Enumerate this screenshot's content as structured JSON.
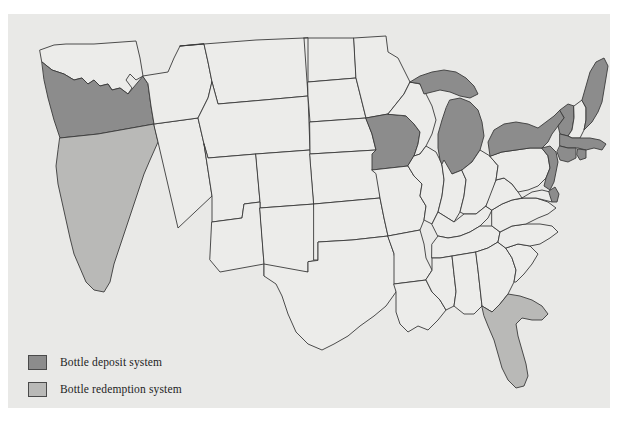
{
  "figure": {
    "panel_background": "#e9e9e7",
    "page_background": "#ffffff"
  },
  "map": {
    "region": "United States",
    "outline_color": "#3a3a3a",
    "unshaded_fill": "#ececea",
    "categories": [
      {
        "key": "deposit",
        "label": "Bottle deposit system",
        "color": "#8c8c8c",
        "states": [
          "Oregon",
          "Iowa",
          "Michigan",
          "New York",
          "Vermont",
          "Maine",
          "Massachusetts",
          "Connecticut",
          "Rhode Island",
          "New Jersey",
          "Delaware"
        ]
      },
      {
        "key": "redemption",
        "label": "Bottle redemption system",
        "color": "#b9b9b7",
        "states": [
          "California",
          "Florida"
        ]
      },
      {
        "key": "none",
        "label": "",
        "color": "#ececea",
        "states": [
          "Washington",
          "Idaho",
          "Nevada",
          "Montana",
          "Wyoming",
          "Utah",
          "Arizona",
          "Colorado",
          "New Mexico",
          "North Dakota",
          "South Dakota",
          "Nebraska",
          "Kansas",
          "Oklahoma",
          "Texas",
          "Minnesota",
          "Wisconsin",
          "Illinois",
          "Missouri",
          "Arkansas",
          "Louisiana",
          "Mississippi",
          "Alabama",
          "Tennessee",
          "Kentucky",
          "Indiana",
          "Ohio",
          "West Virginia",
          "Virginia",
          "Maryland",
          "Pennsylvania",
          "North Carolina",
          "South Carolina",
          "Georgia",
          "New Hampshire"
        ]
      }
    ]
  },
  "legend": {
    "items": [
      {
        "label": "Bottle deposit system",
        "color": "#8c8c8c"
      },
      {
        "label": "Bottle redemption system",
        "color": "#b9b9b7"
      }
    ]
  }
}
